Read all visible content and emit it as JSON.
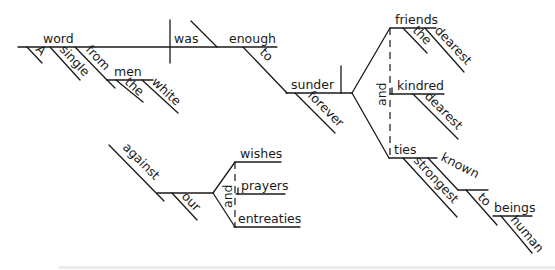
{
  "sentence": "A single word from the white men was enough to sunder forever the dearest friends and dearest kindred and strongest ties known to human beings against our wishes and prayers and entreaties",
  "words": {
    "subject": "word",
    "subject_mod_1": "A",
    "subject_mod_2": "single",
    "prep_from": "from",
    "from_object": "men",
    "men_mod_1": "the",
    "men_mod_2": "white",
    "verb": "was",
    "predicate_adjective": "enough",
    "infinitive_to": "to",
    "infinitive_verb": "sunder",
    "adverb": "forever",
    "object_1": "friends",
    "object_1_mod_1": "the",
    "object_1_mod_2": "dearest",
    "conjunction_objects": "and",
    "object_2": "kindred",
    "object_2_mod": "dearest",
    "object_3": "ties",
    "object_3_mod": "strongest",
    "participle": "known",
    "participle_prep": "to",
    "participle_object": "beings",
    "participle_object_mod": "human",
    "prep_against": "against",
    "against_mod": "our",
    "against_conjunction": "and",
    "against_object_1": "wishes",
    "against_object_2": "prayers",
    "against_object_3": "entreaties"
  }
}
